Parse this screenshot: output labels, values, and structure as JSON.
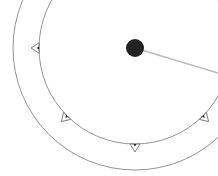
{
  "dial": {
    "center": [
      135,
      48
    ],
    "inner_radius": 96,
    "outer_radius": 122,
    "knob_color": "#222222",
    "line_color": "#bbbbbb",
    "ring_color": "#777777",
    "pointer_end": [
      218,
      73
    ],
    "markers_deg": [
      180,
      135,
      90,
      45
    ]
  }
}
